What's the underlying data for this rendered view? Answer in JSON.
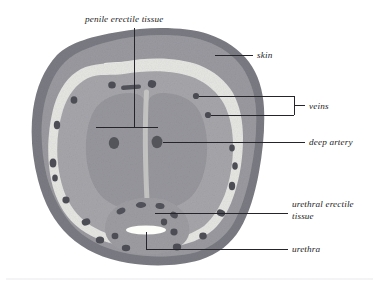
{
  "figure": {
    "kind": "anatomical-cross-section",
    "background_color": "#ffffff"
  },
  "palette": {
    "skin_outer": "#8c8c92",
    "skin_rim_dark": "#6f6f77",
    "subcutaneous": "#9d9da3",
    "pale_ring": "#e4e4e2",
    "erectile_tissue": "#a3a3a8",
    "corpus_fill": "#9a9a9f",
    "vessel_dark": "#4e4e55",
    "urethra_white": "#fdfdfb",
    "leader_line": "#24242a",
    "text": "#1c1c1c"
  },
  "labels": {
    "penile_erectile_tissue": "penile erectile tissue",
    "skin": "skin",
    "veins": "veins",
    "deep_artery": "deep artery",
    "urethral_erectile_tissue_line1": "urethral erectile",
    "urethral_erectile_tissue_line2": "tissue",
    "urethra": "urethra"
  },
  "structures": [
    {
      "name": "skin",
      "description": "outer dark gray rim enclosing the section"
    },
    {
      "name": "subcutaneous-layer",
      "description": "medium gray layer beneath skin"
    },
    {
      "name": "pale-ring",
      "description": "light band containing the veins"
    },
    {
      "name": "corpus-cavernosum-left",
      "description": "left penile erectile body"
    },
    {
      "name": "corpus-cavernosum-right",
      "description": "right penile erectile body"
    },
    {
      "name": "septum",
      "description": "pale partition between the two corpora"
    },
    {
      "name": "corpus-spongiosum",
      "description": "urethral erectile tissue, ventral"
    },
    {
      "name": "urethra",
      "description": "white horizontal slit within corpus spongiosum"
    },
    {
      "name": "deep-artery-left",
      "description": "dark round vessel in left corpus"
    },
    {
      "name": "deep-artery-right",
      "description": "dark round vessel in right corpus"
    }
  ]
}
